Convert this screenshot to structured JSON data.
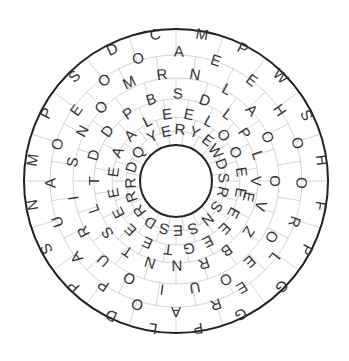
{
  "puzzle": {
    "type": "circular-word-search",
    "center": [
      176,
      181
    ],
    "outer_radius": 152,
    "inner_radius": 36,
    "grid_radii": [
      152,
      126,
      103,
      82,
      64,
      50
    ],
    "colors": {
      "letters": "#333333",
      "grid": "#c8c8c8",
      "border": "#222222",
      "background": "#ffffff"
    },
    "letters": [
      {
        "ch": "D",
        "x": 112,
        "y": 49
      },
      {
        "ch": "C",
        "x": 155,
        "y": 34
      },
      {
        "ch": "M",
        "x": 202,
        "y": 34
      },
      {
        "ch": "P",
        "x": 243,
        "y": 48
      },
      {
        "ch": "W",
        "x": 281,
        "y": 76
      },
      {
        "ch": "S",
        "x": 307,
        "y": 115
      },
      {
        "ch": "H",
        "x": 322,
        "y": 160
      },
      {
        "ch": "F",
        "x": 321,
        "y": 206
      },
      {
        "ch": "P",
        "x": 307,
        "y": 250
      },
      {
        "ch": "G",
        "x": 282,
        "y": 287
      },
      {
        "ch": "G",
        "x": 241,
        "y": 315
      },
      {
        "ch": "P",
        "x": 198,
        "y": 329
      },
      {
        "ch": "L",
        "x": 153,
        "y": 329
      },
      {
        "ch": "D",
        "x": 111,
        "y": 316
      },
      {
        "ch": "P",
        "x": 73,
        "y": 287
      },
      {
        "ch": "S",
        "x": 46,
        "y": 249
      },
      {
        "ch": "N",
        "x": 32,
        "y": 205
      },
      {
        "ch": "M",
        "x": 32,
        "y": 160
      },
      {
        "ch": "P",
        "x": 46,
        "y": 113
      },
      {
        "ch": "S",
        "x": 74,
        "y": 76
      },
      {
        "ch": "O",
        "x": 138,
        "y": 58
      },
      {
        "ch": "A",
        "x": 179,
        "y": 51
      },
      {
        "ch": "E",
        "x": 216,
        "y": 60
      },
      {
        "ch": "E",
        "x": 252,
        "y": 80
      },
      {
        "ch": "H",
        "x": 280,
        "y": 110
      },
      {
        "ch": "O",
        "x": 298,
        "y": 143
      },
      {
        "ch": "O",
        "x": 302,
        "y": 183
      },
      {
        "ch": "R",
        "x": 295,
        "y": 222
      },
      {
        "ch": "L",
        "x": 275,
        "y": 258
      },
      {
        "ch": "E",
        "x": 242,
        "y": 288
      },
      {
        "ch": "R",
        "x": 216,
        "y": 305
      },
      {
        "ch": "A",
        "x": 176,
        "y": 312
      },
      {
        "ch": "O",
        "x": 137,
        "y": 305
      },
      {
        "ch": "P",
        "x": 103,
        "y": 286
      },
      {
        "ch": "A",
        "x": 76,
        "y": 258
      },
      {
        "ch": "U",
        "x": 57,
        "y": 222
      },
      {
        "ch": "A",
        "x": 50,
        "y": 183
      },
      {
        "ch": "O",
        "x": 57,
        "y": 144
      },
      {
        "ch": "E",
        "x": 76,
        "y": 110
      },
      {
        "ch": "O",
        "x": 104,
        "y": 80
      },
      {
        "ch": "M",
        "x": 129,
        "y": 82
      },
      {
        "ch": "R",
        "x": 162,
        "y": 74
      },
      {
        "ch": "N",
        "x": 195,
        "y": 74
      },
      {
        "ch": "L",
        "x": 227,
        "y": 89
      },
      {
        "ch": "A",
        "x": 252,
        "y": 110
      },
      {
        "ch": "O",
        "x": 268,
        "y": 137
      },
      {
        "ch": "O",
        "x": 275,
        "y": 181
      },
      {
        "ch": "V",
        "x": 261,
        "y": 206
      },
      {
        "ch": "O",
        "x": 272,
        "y": 237
      },
      {
        "ch": "E",
        "x": 250,
        "y": 262
      },
      {
        "ch": "O",
        "x": 226,
        "y": 280
      },
      {
        "ch": "U",
        "x": 195,
        "y": 288
      },
      {
        "ch": "I",
        "x": 162,
        "y": 290
      },
      {
        "ch": "O",
        "x": 129,
        "y": 279
      },
      {
        "ch": "U",
        "x": 103,
        "y": 261
      },
      {
        "ch": "R",
        "x": 83,
        "y": 232
      },
      {
        "ch": "I",
        "x": 73,
        "y": 198
      },
      {
        "ch": "S",
        "x": 72,
        "y": 162
      },
      {
        "ch": "N",
        "x": 82,
        "y": 131
      },
      {
        "ch": "O",
        "x": 101,
        "y": 107
      },
      {
        "ch": "B",
        "x": 151,
        "y": 99
      },
      {
        "ch": "S",
        "x": 178,
        "y": 93
      },
      {
        "ch": "D",
        "x": 205,
        "y": 100
      },
      {
        "ch": "L",
        "x": 228,
        "y": 114
      },
      {
        "ch": "P",
        "x": 245,
        "y": 133
      },
      {
        "ch": "L",
        "x": 258,
        "y": 155
      },
      {
        "ch": "E",
        "x": 249,
        "y": 197
      },
      {
        "ch": "V",
        "x": 256,
        "y": 181
      },
      {
        "ch": "Z",
        "x": 249,
        "y": 232
      },
      {
        "ch": "B",
        "x": 227,
        "y": 251
      },
      {
        "ch": "R",
        "x": 204,
        "y": 264
      },
      {
        "ch": "N",
        "x": 177,
        "y": 266
      },
      {
        "ch": "N",
        "x": 150,
        "y": 263
      },
      {
        "ch": "T",
        "x": 127,
        "y": 252
      },
      {
        "ch": "S",
        "x": 107,
        "y": 233
      },
      {
        "ch": "L",
        "x": 93,
        "y": 209
      },
      {
        "ch": "T",
        "x": 93,
        "y": 181
      },
      {
        "ch": "D",
        "x": 93,
        "y": 155
      },
      {
        "ch": "D",
        "x": 107,
        "y": 131
      },
      {
        "ch": "P",
        "x": 128,
        "y": 113
      },
      {
        "ch": "L",
        "x": 147,
        "y": 121
      },
      {
        "ch": "E",
        "x": 167,
        "y": 114
      },
      {
        "ch": "E",
        "x": 189,
        "y": 114
      },
      {
        "ch": "L",
        "x": 209,
        "y": 121
      },
      {
        "ch": "O",
        "x": 224,
        "y": 135
      },
      {
        "ch": "O",
        "x": 236,
        "y": 152
      },
      {
        "ch": "E",
        "x": 242,
        "y": 172
      },
      {
        "ch": "E",
        "x": 241,
        "y": 193
      },
      {
        "ch": "E",
        "x": 234,
        "y": 213
      },
      {
        "ch": "E",
        "x": 225,
        "y": 229
      },
      {
        "ch": "E",
        "x": 208,
        "y": 242
      },
      {
        "ch": "G",
        "x": 189,
        "y": 249
      },
      {
        "ch": "T",
        "x": 168,
        "y": 250
      },
      {
        "ch": "E",
        "x": 147,
        "y": 243
      },
      {
        "ch": "E",
        "x": 130,
        "y": 230
      },
      {
        "ch": "E",
        "x": 118,
        "y": 213
      },
      {
        "ch": "E",
        "x": 113,
        "y": 193
      },
      {
        "ch": "E",
        "x": 113,
        "y": 172
      },
      {
        "ch": "A",
        "x": 117,
        "y": 152
      },
      {
        "ch": "A",
        "x": 130,
        "y": 135
      },
      {
        "ch": "Y",
        "x": 152,
        "y": 136
      },
      {
        "ch": "E",
        "x": 166,
        "y": 131
      },
      {
        "ch": "R",
        "x": 180,
        "y": 129
      },
      {
        "ch": "Y",
        "x": 195,
        "y": 132
      },
      {
        "ch": "E",
        "x": 208,
        "y": 140
      },
      {
        "ch": "W",
        "x": 216,
        "y": 151
      },
      {
        "ch": "D",
        "x": 222,
        "y": 164
      },
      {
        "ch": "S",
        "x": 224,
        "y": 178
      },
      {
        "ch": "R",
        "x": 223,
        "y": 192
      },
      {
        "ch": "S",
        "x": 217,
        "y": 207
      },
      {
        "ch": "N",
        "x": 208,
        "y": 220
      },
      {
        "ch": "S",
        "x": 193,
        "y": 229
      },
      {
        "ch": "E",
        "x": 178,
        "y": 231
      },
      {
        "ch": "S",
        "x": 164,
        "y": 229
      },
      {
        "ch": "D",
        "x": 150,
        "y": 223
      },
      {
        "ch": "R",
        "x": 139,
        "y": 211
      },
      {
        "ch": "R",
        "x": 131,
        "y": 197
      },
      {
        "ch": "R",
        "x": 130,
        "y": 183
      },
      {
        "ch": "D",
        "x": 131,
        "y": 167
      },
      {
        "ch": "Q",
        "x": 138,
        "y": 152
      }
    ]
  }
}
